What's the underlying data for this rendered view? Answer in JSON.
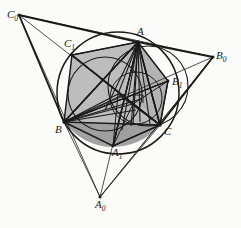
{
  "figure": {
    "width": 241,
    "height": 228,
    "background_color": "#fbfbfa",
    "stroke_color": "#1a1a1a",
    "fill_shade_light": "#b8b8b8",
    "fill_shade_dark": "#9a9a9a"
  },
  "labels": {
    "A": {
      "text": "A",
      "sub": "",
      "x": 137,
      "y": 26
    },
    "B": {
      "text": "B",
      "sub": "",
      "x": 55,
      "y": 124
    },
    "C": {
      "text": "C",
      "sub": "",
      "x": 164,
      "y": 126
    },
    "A1": {
      "text": "A",
      "sub": "1",
      "x": 112,
      "y": 147
    },
    "B1": {
      "text": "B",
      "sub": "1",
      "x": 172,
      "y": 76
    },
    "C1": {
      "text": "C",
      "sub": "1",
      "x": 64,
      "y": 38
    },
    "A0": {
      "text": "A",
      "sub": "0",
      "x": 95,
      "y": 199
    },
    "B0": {
      "text": "B",
      "sub": "0",
      "x": 216,
      "y": 50
    },
    "C0": {
      "text": "C",
      "sub": "0",
      "x": 7,
      "y": 9
    }
  },
  "points": {
    "A": {
      "x": 138,
      "y": 42
    },
    "B": {
      "x": 64,
      "y": 122
    },
    "C": {
      "x": 160,
      "y": 125
    },
    "A1": {
      "x": 113,
      "y": 146
    },
    "B1": {
      "x": 168,
      "y": 81
    },
    "C1": {
      "x": 72,
      "y": 55
    },
    "A0": {
      "x": 100,
      "y": 197
    },
    "B0": {
      "x": 213,
      "y": 57
    },
    "C0": {
      "x": 19,
      "y": 15
    },
    "H": {
      "x": 133,
      "y": 104
    },
    "O": {
      "x": 118,
      "y": 94
    },
    "F": {
      "x": 133,
      "y": 125
    },
    "M": {
      "x": 125,
      "y": 94
    }
  },
  "circles": {
    "circumcircle": {
      "cx": 118,
      "cy": 93,
      "r": 61
    },
    "inner_left": {
      "cx": 105,
      "cy": 94,
      "r": 37
    },
    "inner_right": {
      "cx": 148,
      "cy": 86,
      "r": 40
    },
    "small_arc": {
      "cx": 136,
      "cy": 98,
      "r": 26
    }
  },
  "marks": {
    "right_angle": {
      "x": 134,
      "y": 96,
      "size": 8,
      "name": "right-angle-mark"
    }
  }
}
